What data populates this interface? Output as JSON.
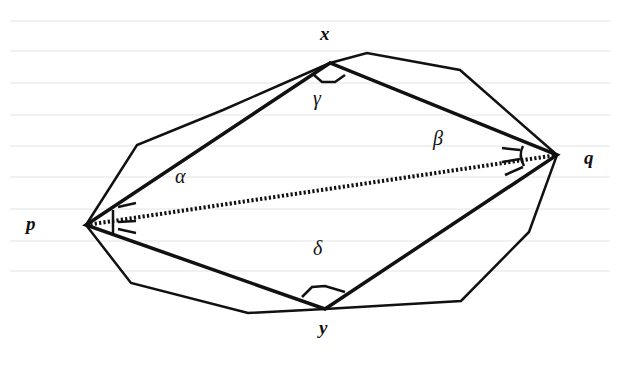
{
  "diagram": {
    "vertex_labels": {
      "x": "x",
      "y": "y",
      "p": "p",
      "q": "q"
    },
    "angle_labels": {
      "alpha": "α",
      "beta": "β",
      "gamma": "γ",
      "delta": "δ"
    },
    "colors": {
      "stroke": "#111111",
      "background": "#ffffff"
    }
  }
}
